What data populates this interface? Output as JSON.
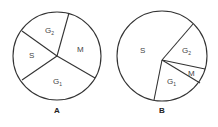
{
  "diagrams": [
    {
      "id": "A",
      "caption": "A",
      "segments": [
        {
          "label": "G",
          "sub": "2"
        },
        {
          "label": "M",
          "sub": ""
        },
        {
          "label": "G",
          "sub": "1"
        },
        {
          "label": "S",
          "sub": ""
        }
      ]
    },
    {
      "id": "B",
      "caption": "B",
      "segments": [
        {
          "label": "S",
          "sub": ""
        },
        {
          "label": "G",
          "sub": "2"
        },
        {
          "label": "M",
          "sub": ""
        },
        {
          "label": "G",
          "sub": "1"
        }
      ]
    }
  ],
  "colors": {
    "stroke": "#333333",
    "background": "#ffffff"
  }
}
